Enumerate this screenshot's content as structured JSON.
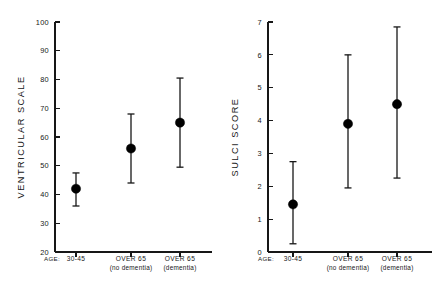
{
  "figure": {
    "background_color": "#ffffff",
    "ink_color": "#171717",
    "marker_color": "#000000"
  },
  "chart_data": [
    {
      "type": "scatter",
      "panel": "left",
      "title": "",
      "ylabel": "VENTRICULAR  SCALE",
      "xlabel": "",
      "x_prefix_label": "AGE:",
      "ylim": [
        20,
        100
      ],
      "yticks": [
        20,
        30,
        40,
        50,
        60,
        70,
        80,
        90,
        100
      ],
      "ytick_labels": [
        "20",
        "30",
        "40",
        "50",
        "60",
        "70",
        "80",
        "90",
        "100"
      ],
      "grid": false,
      "legend": "none",
      "error_bar_style": "capped-vertical-range",
      "categories": [
        "30-45",
        "OVER 65",
        "OVER 65"
      ],
      "category_sublabels": [
        "",
        "(no dementia)",
        "(dementia)"
      ],
      "values": [
        42,
        56,
        65
      ],
      "err_low": [
        36,
        44,
        49.5
      ],
      "err_high": [
        47.5,
        68,
        80.5
      ]
    },
    {
      "type": "scatter",
      "panel": "right",
      "title": "",
      "ylabel": "SULCI  SCORE",
      "xlabel": "",
      "x_prefix_label": "AGE:",
      "ylim": [
        0,
        7
      ],
      "yticks": [
        0,
        1,
        2,
        3,
        4,
        5,
        6,
        7
      ],
      "ytick_labels": [
        "0",
        "1",
        "2",
        "3",
        "4",
        "5",
        "6",
        "7"
      ],
      "grid": false,
      "legend": "none",
      "error_bar_style": "capped-vertical-range",
      "categories": [
        "30-45",
        "OVER 65",
        "OVER 65"
      ],
      "category_sublabels": [
        "",
        "(no dementia)",
        "(dementia)"
      ],
      "values": [
        1.45,
        3.9,
        4.5
      ],
      "err_low": [
        0.25,
        1.95,
        2.25
      ],
      "err_high": [
        2.75,
        6.0,
        6.85
      ]
    }
  ]
}
